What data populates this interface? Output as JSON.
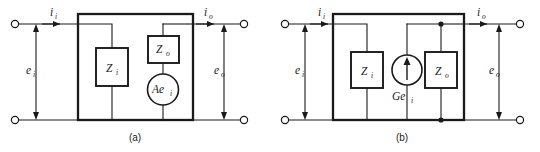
{
  "figure": {
    "type": "circuit-diagram",
    "background_color": "#ffffff",
    "line_color": "#1a1a1a"
  },
  "panels": [
    {
      "id": "a",
      "caption": "(a)",
      "model": "voltage-source (Thevenin) equivalent",
      "labels": {
        "input_current": {
          "var": "i",
          "sub": "i"
        },
        "input_voltage": {
          "var": "e",
          "sub": "i"
        },
        "output_current": {
          "var": "i",
          "sub": "o"
        },
        "output_voltage": {
          "var": "e",
          "sub": "o"
        }
      },
      "components": [
        {
          "name": "input-impedance",
          "var": "Z",
          "sub": "i",
          "shape": "box"
        },
        {
          "name": "output-impedance",
          "var": "Z",
          "sub": "o",
          "shape": "box"
        },
        {
          "name": "dependent-voltage-source",
          "var": "Ae",
          "sub": "i",
          "shape": "circle"
        }
      ]
    },
    {
      "id": "b",
      "caption": "(b)",
      "model": "current-source (Norton) equivalent",
      "labels": {
        "input_current": {
          "var": "i",
          "sub": "i"
        },
        "input_voltage": {
          "var": "e",
          "sub": "i"
        },
        "output_current": {
          "var": "i",
          "sub": "o"
        },
        "output_voltage": {
          "var": "e",
          "sub": "o"
        }
      },
      "components": [
        {
          "name": "input-impedance",
          "var": "Z",
          "sub": "i",
          "shape": "box"
        },
        {
          "name": "output-impedance",
          "var": "Z",
          "sub": "o",
          "shape": "box"
        },
        {
          "name": "dependent-current-source",
          "var": "Ge",
          "sub": "i",
          "shape": "circle-arrow"
        }
      ]
    }
  ]
}
